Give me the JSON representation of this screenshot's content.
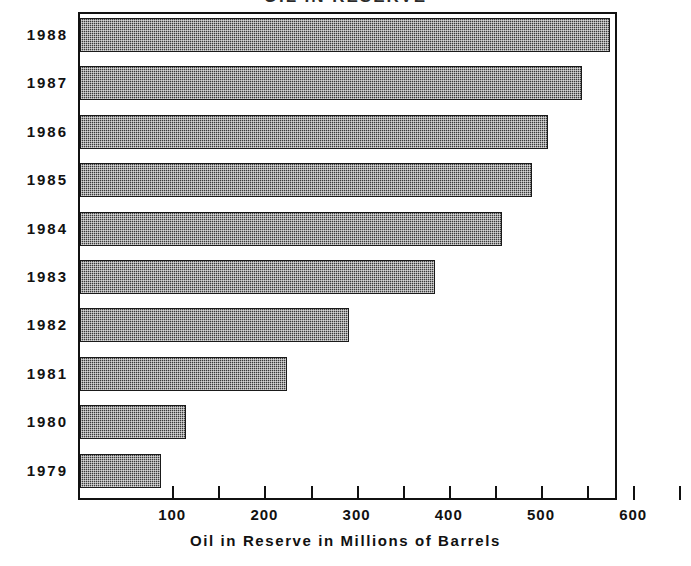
{
  "chart_data": {
    "type": "bar",
    "orientation": "horizontal",
    "title": "OIL IN RESERVE",
    "xlabel": "Oil in Reserve in Millions of Barrels",
    "ylabel": "",
    "categories": [
      "1988",
      "1987",
      "1986",
      "1985",
      "1984",
      "1983",
      "1982",
      "1981",
      "1980",
      "1979"
    ],
    "values": [
      575,
      545,
      508,
      490,
      458,
      385,
      292,
      225,
      115,
      88
    ],
    "xlim": [
      0,
      650
    ],
    "ylim": null,
    "xticks": [
      100,
      200,
      300,
      400,
      500,
      600
    ],
    "xtick_labels": [
      "100",
      "200",
      "300",
      "400",
      "500",
      "600"
    ],
    "xminor_ticks": [
      150,
      250,
      350,
      450,
      550,
      650
    ],
    "grid": false,
    "legend": null,
    "series": [
      {
        "name": "Oil in Reserve",
        "color": "#3a3a3a",
        "values": [
          575,
          545,
          508,
          490,
          458,
          385,
          292,
          225,
          115,
          88
        ]
      }
    ]
  },
  "axis": {
    "x_title": "Oil in Reserve in Millions of Barrels",
    "tick_labels": [
      "100",
      "200",
      "300",
      "400",
      "500",
      "600"
    ],
    "category_labels": [
      "1988",
      "1987",
      "1986",
      "1985",
      "1984",
      "1983",
      "1982",
      "1981",
      "1980",
      "1979"
    ]
  },
  "colors": {
    "bar_fill": "#3a3a3a",
    "bar_border": "#1a1a1a",
    "axis": "#111111",
    "background": "#ffffff",
    "text": "#111111"
  }
}
